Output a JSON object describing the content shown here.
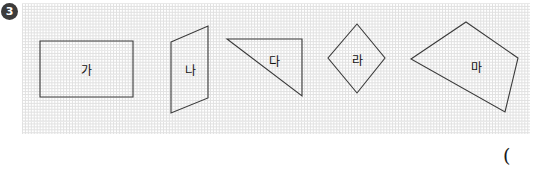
{
  "problem": {
    "number": "3",
    "badge_color": "#3c3c3c",
    "badge_text_color": "#ffffff"
  },
  "grid": {
    "cell_size_px": 23.5,
    "line_color": "#c9c9c9",
    "line_style": "dotted",
    "x": 22,
    "y": 3,
    "width": 508,
    "height": 131
  },
  "stroke": {
    "shape_color": "#3a3a3a",
    "shape_width": 1.1
  },
  "shapes": [
    {
      "label": "가",
      "name": "rectangle",
      "points": "40,41 133,41 133,97 40,97",
      "label_x": 86,
      "label_y": 69
    },
    {
      "label": "나",
      "name": "parallelogram",
      "points": "171,42 208,26 208,98 171,113",
      "label_x": 190,
      "label_y": 69
    },
    {
      "label": "다",
      "name": "right-triangle",
      "points": "227,39 302,39 302,96",
      "label_x": 274,
      "label_y": 60
    },
    {
      "label": "라",
      "name": "rhombus",
      "points": "357,24 385,58 357,93 328,58",
      "label_x": 357,
      "label_y": 59
    },
    {
      "label": "마",
      "name": "irregular-quadrilateral",
      "points": "466,22 518,58 505,112 411,59",
      "label_x": 476,
      "label_y": 66
    }
  ],
  "answer": {
    "open_paren": "("
  }
}
